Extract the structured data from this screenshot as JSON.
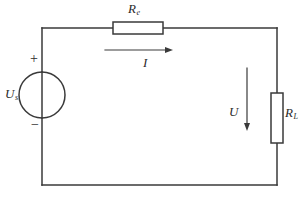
{
  "diagram": {
    "background_color": "#ffffff",
    "line_color": "#3a3a3a",
    "text_color": "#2b2b2b"
  },
  "labels": {
    "source_symbol": "U",
    "source_subscript": "s",
    "series_resistor_symbol": "R",
    "series_resistor_subscript": "e",
    "load_resistor_symbol": "R",
    "load_resistor_subscript": "L",
    "current_symbol": "I",
    "voltage_symbol": "U",
    "polarity_positive": "+",
    "polarity_negative": "−"
  },
  "geometry": {
    "loop": {
      "left": 42,
      "top": 28,
      "right": 277,
      "bottom": 185
    },
    "source_circle": {
      "cx": 42,
      "cy": 95,
      "r": 23
    },
    "series_resistor_box": {
      "x": 113,
      "y": 22,
      "width": 50,
      "height": 12
    },
    "load_resistor_box": {
      "x": 271,
      "y": 93,
      "width": 12,
      "height": 50
    },
    "current_arrow": {
      "x1": 105,
      "y1": 50,
      "x2": 172,
      "y2": 50,
      "direction": "right"
    },
    "voltage_arrow": {
      "x1": 247,
      "y1": 68,
      "x2": 247,
      "y2": 130,
      "direction": "down"
    }
  }
}
